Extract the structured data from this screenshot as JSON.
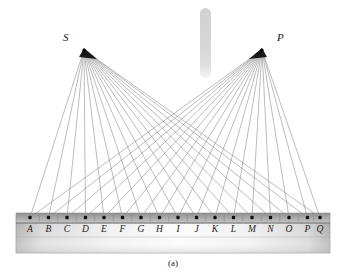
{
  "figure": {
    "caption": "(a)",
    "background_color": "#ffffff",
    "width": 346,
    "height": 275
  },
  "sources": [
    {
      "label": "S",
      "x": 84,
      "y": 50,
      "label_x": 63,
      "label_y": 32
    },
    {
      "label": "P",
      "x": 262,
      "y": 50,
      "label_x": 277,
      "label_y": 32
    }
  ],
  "ray_color": "#6e6e6e",
  "detector": {
    "name": "screen-bar",
    "x": 16,
    "y": 213,
    "width": 314,
    "height": 40,
    "strip_height": 10,
    "strip_color_top": "#9a9a9a",
    "strip_color_bottom": "#bdbdbd",
    "panel_color_edge": "#b8b8b8",
    "panel_color_center": "#f2f2f2",
    "border_color": "#8a8a8a",
    "point_color": "#111111",
    "tick_color": "#7d7d7d"
  },
  "points": [
    {
      "label": "A",
      "x": 30
    },
    {
      "label": "B",
      "x": 48.5
    },
    {
      "label": "C",
      "x": 67
    },
    {
      "label": "D",
      "x": 85.5
    },
    {
      "label": "E",
      "x": 104
    },
    {
      "label": "F",
      "x": 122.5
    },
    {
      "label": "G",
      "x": 141
    },
    {
      "label": "H",
      "x": 159.5
    },
    {
      "label": "I",
      "x": 178
    },
    {
      "label": "J",
      "x": 196.5
    },
    {
      "label": "K",
      "x": 215
    },
    {
      "label": "L",
      "x": 233.5
    },
    {
      "label": "M",
      "x": 252
    },
    {
      "label": "N",
      "x": 270.5
    },
    {
      "label": "O",
      "x": 289
    },
    {
      "label": "P",
      "x": 307.5
    },
    {
      "label": "Q",
      "x": 320
    }
  ],
  "slit": {
    "name": "slit-bar",
    "x": 200,
    "y": 8,
    "width": 11,
    "height": 70,
    "color": "#d4d4d4",
    "color_fade": "#ebebeb"
  },
  "labels": {
    "point_label_y": 232,
    "point_label_font_size": 9.5
  }
}
